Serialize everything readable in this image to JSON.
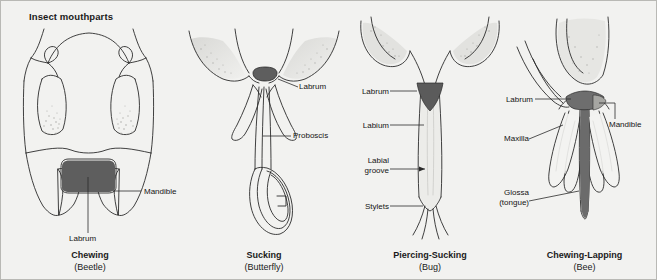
{
  "figure": {
    "title": "Insect mouthparts",
    "background_color": "#f2f2f0",
    "border_color": "#b9b9b5",
    "line_color": "#2b2b2b",
    "shade_dark": "#5b5b5b",
    "shade_mid": "#8e8e8e",
    "shade_light": "#d2d2cf"
  },
  "panels": [
    {
      "id": "chewing-beetle",
      "caption_name": "Chewing",
      "caption_taxon": "(Beetle)",
      "labels": [
        {
          "text": "Mandible",
          "name": "label-mandible"
        },
        {
          "text": "Labrum",
          "name": "label-labrum"
        }
      ]
    },
    {
      "id": "sucking-butterfly",
      "caption_name": "Sucking",
      "caption_taxon": "(Butterfly)",
      "labels": [
        {
          "text": "Labrum",
          "name": "label-labrum"
        },
        {
          "text": "Proboscis",
          "name": "label-proboscis"
        }
      ]
    },
    {
      "id": "piercing-sucking-bug",
      "caption_name": "Piercing-Sucking",
      "caption_taxon": "(Bug)",
      "labels": [
        {
          "text": "Labrum",
          "name": "label-labrum"
        },
        {
          "text": "Labium",
          "name": "label-labium"
        },
        {
          "text": "Labial",
          "name": "label-labial-groove-line1"
        },
        {
          "text": "groove",
          "name": "label-labial-groove-line2"
        },
        {
          "text": "Stylets",
          "name": "label-stylets"
        }
      ]
    },
    {
      "id": "chewing-lapping-bee",
      "caption_name": "Chewing-Lapping",
      "caption_taxon": "(Bee)",
      "labels": [
        {
          "text": "Labrum",
          "name": "label-labrum"
        },
        {
          "text": "Mandible",
          "name": "label-mandible"
        },
        {
          "text": "Maxilla",
          "name": "label-maxilla"
        },
        {
          "text": "Glossa",
          "name": "label-glossa-line1"
        },
        {
          "text": "(tongue)",
          "name": "label-glossa-line2"
        }
      ]
    }
  ]
}
